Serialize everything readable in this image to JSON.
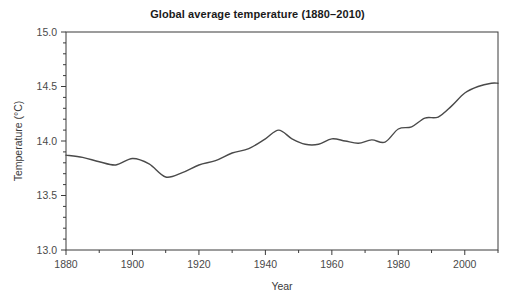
{
  "chart_data": {
    "type": "line",
    "title": "Global average temperature (1880–2010)",
    "xlabel": "Year",
    "ylabel": "Temperature (°C)",
    "xlim": [
      1880,
      2010
    ],
    "ylim": [
      13.0,
      15.0
    ],
    "grid": false,
    "legend": null,
    "line_color": "#4a4a4a",
    "frame_color": "#3a3a3a",
    "x_ticks": [
      1880,
      1900,
      1920,
      1940,
      1960,
      1980,
      2000
    ],
    "x_tick_labels": [
      "1880",
      "1900",
      "1920",
      "1940",
      "1960",
      "1980",
      "2000"
    ],
    "x_minor_tick_step": 10,
    "y_ticks": [
      13.0,
      13.5,
      14.0,
      14.5,
      15.0
    ],
    "y_tick_labels": [
      "13.0",
      "13.5",
      "14.0",
      "14.5",
      "15.0"
    ],
    "y_minor_tick_step": 0.1,
    "series": [
      {
        "name": "Global average temperature",
        "x": [
          1880,
          1885,
          1890,
          1895,
          1900,
          1905,
          1910,
          1915,
          1920,
          1925,
          1930,
          1935,
          1940,
          1944,
          1948,
          1952,
          1956,
          1960,
          1964,
          1968,
          1972,
          1976,
          1980,
          1984,
          1988,
          1992,
          1996,
          2000,
          2004,
          2008,
          2010
        ],
        "values": [
          13.87,
          13.85,
          13.81,
          13.78,
          13.84,
          13.79,
          13.67,
          13.71,
          13.78,
          13.82,
          13.89,
          13.93,
          14.02,
          14.1,
          14.02,
          13.97,
          13.97,
          14.02,
          14.0,
          13.98,
          14.01,
          13.99,
          14.11,
          14.13,
          14.21,
          14.22,
          14.32,
          14.44,
          14.5,
          14.53,
          14.53
        ]
      }
    ]
  },
  "figure": {
    "plot_left_px": 66,
    "plot_right_px": 498,
    "plot_top_px": 32,
    "plot_bottom_px": 250
  }
}
